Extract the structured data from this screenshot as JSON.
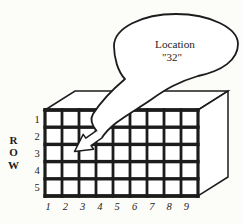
{
  "colors": {
    "ink": "#1c1c1c",
    "paper": "#fcfcf9",
    "cell_fill": "#ffffff"
  },
  "callout": {
    "line1": "Location",
    "line2": "\"32\"",
    "points_to": {
      "row": 3,
      "column": 2
    }
  },
  "row_axis": {
    "letters": [
      "R",
      "O",
      "W"
    ]
  },
  "grid": {
    "rows": 5,
    "cols": 9,
    "row_labels": [
      "1",
      "2",
      "3",
      "4",
      "5"
    ],
    "col_labels": [
      "1",
      "2",
      "3",
      "4",
      "5",
      "6",
      "7",
      "8",
      "9"
    ]
  }
}
